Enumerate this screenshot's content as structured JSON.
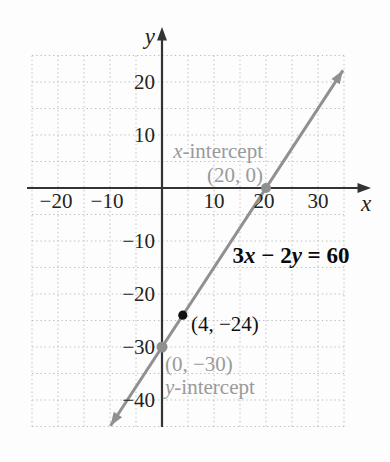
{
  "figure": {
    "background": "#fdfdfd",
    "grid_color": "#bfbfbf",
    "axis_color": "#333333",
    "line_color": "#909090",
    "gray_label_color": "#9a9a9a",
    "black_label_color": "#101010"
  },
  "chart_data": {
    "type": "line",
    "title": "",
    "equation": {
      "full": "3x − 2y = 60",
      "parts": [
        "3",
        "x",
        " − 2",
        "y",
        " = 60"
      ]
    },
    "x_axis": {
      "label": "x",
      "range": [
        -25,
        35
      ],
      "grid_step": 5,
      "tick_step": 10,
      "tick_values": [
        -20,
        -10,
        10,
        20,
        30
      ],
      "tick_labels": [
        "−20",
        "−10",
        "10",
        "20",
        "30"
      ]
    },
    "y_axis": {
      "label": "y",
      "range": [
        -45,
        25
      ],
      "grid_step": 5,
      "tick_step": 10,
      "tick_values": [
        20,
        10,
        -10,
        -20,
        -30,
        -40
      ],
      "tick_labels": [
        "20",
        "10",
        "−10",
        "−20",
        "−30",
        "−40"
      ]
    },
    "line": {
      "color": "#909090",
      "slope": 1.5,
      "endpoints_math": [
        [
          -9.9,
          -44.85
        ],
        [
          34.8,
          22.2
        ]
      ],
      "x_intercept": [
        20,
        0
      ],
      "y_intercept": [
        0,
        -30
      ]
    },
    "points": [
      {
        "x": 20,
        "y": 0,
        "r": 5,
        "color": "#8f8f8f",
        "name": "x-intercept-point"
      },
      {
        "x": 0,
        "y": -30,
        "r": 5.5,
        "color": "#8f8f8f",
        "name": "y-intercept-point"
      },
      {
        "x": 4,
        "y": -24,
        "r": 4.6,
        "color": "#111111",
        "name": "highlighted-point"
      }
    ],
    "annotations": {
      "x_intercept_title_parts": [
        "x",
        "-intercept"
      ],
      "x_intercept_coords": "(20, 0)",
      "point_label": "(4, −24)",
      "y_intercept_coords": "(0, −30)",
      "y_intercept_title_parts": [
        "y",
        "-intercept"
      ]
    }
  }
}
